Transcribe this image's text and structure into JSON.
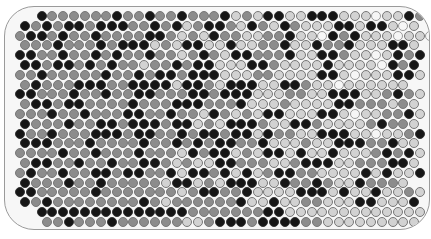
{
  "game": {
    "title": "Hex circle board",
    "colors": {
      "B": "#161616",
      "D": "#8c8c8c",
      "L": "#d2d2d2",
      "W": "#f6f6f6"
    },
    "grid": {
      "origin_x": 10,
      "origin_y": 4,
      "col_spacing": 10.8,
      "row_spacing": 9.8,
      "odd_row_offset": -5.4,
      "rows": [
        "  BDDDDDDBDDBDDBDDDBLDLBBLLBBBLLLWLLBDB ",
        " BDBDBBDBBBDDBDBLDBBDLBDLBDLLLBBLBBLWL ",
        "DBBDBDDBDDDDBBDLDLBDDLLDDBLLWBDBLLLWLLW",
        " DDDBDDDBDBBBLDLBBLLBLLDDBLLBDDBLLLBBL ",
        "BBDDBDDBDBDDBDDLDBDLBBDDDBLLBBDLLWLBDB ",
        " BBDBBDBDBDDLDDBDBBLLLBBDLLLLBLLLLWBDB ",
        "DDBDDDDDBDDBDBBDBBBLLLDDLLLLBBLWLLLBBL ",
        " DBDDDBBBDDBBBBLBBDLBBBLLBBDLLWLLLLLL ",
        "BBDDDBDDBDDBBDDDBBDBBBLLLDDLLBBBLLDBDL ",
        " DBBDBBDDDDBDDDBBBDDDBLLLDLLLLBBDDDLDL ",
        "DDDBDDBDDDBBDDBDDLBDLDLBBLLLBBLWLLDDBL ",
        " BDDDBDDBBDBBBDBBLDLBBBDLLBBDLLLLDBDDL ",
        "BDDBDDDBBBDBBDDBDBBDBBLBDDLLBBBLLWLLDB ",
        " BBBDDDBDDDDBDDBDBDBBDDBLLLDLLBBBDDBLL ",
        "DDDDBDDBDDDBDDDLBDBBLDLBBLBLLBLLLDBDBL ",
        " DBBDDBDDBDDBBDLDLLBBDDDLLDBBBLLDDDBBL ",
        "DBDDBDDBBDBBDDBLBBDBLBLDBBDDLLLLBLBLLB ",
        " BDDDBDDBDDDDDLBBLDLBBBLLBDDBDLLBDDDL ",
        "BBDDDDDBDDDDDDDLDBBDDBLLLLBBBLBLLBLLDL ",
        " BDBDDDDDDDDBDLDDDDDDBLLBLLDDLLLBBLLLB ",
        "  BBBBBBBBBBBBBBDDDDDDDBBLLLLLLLLLLLLL ",
        "   DDBDDDBDDDDDDLLDBBBDBBBBDDLLLLLLLLL "
      ]
    }
  }
}
